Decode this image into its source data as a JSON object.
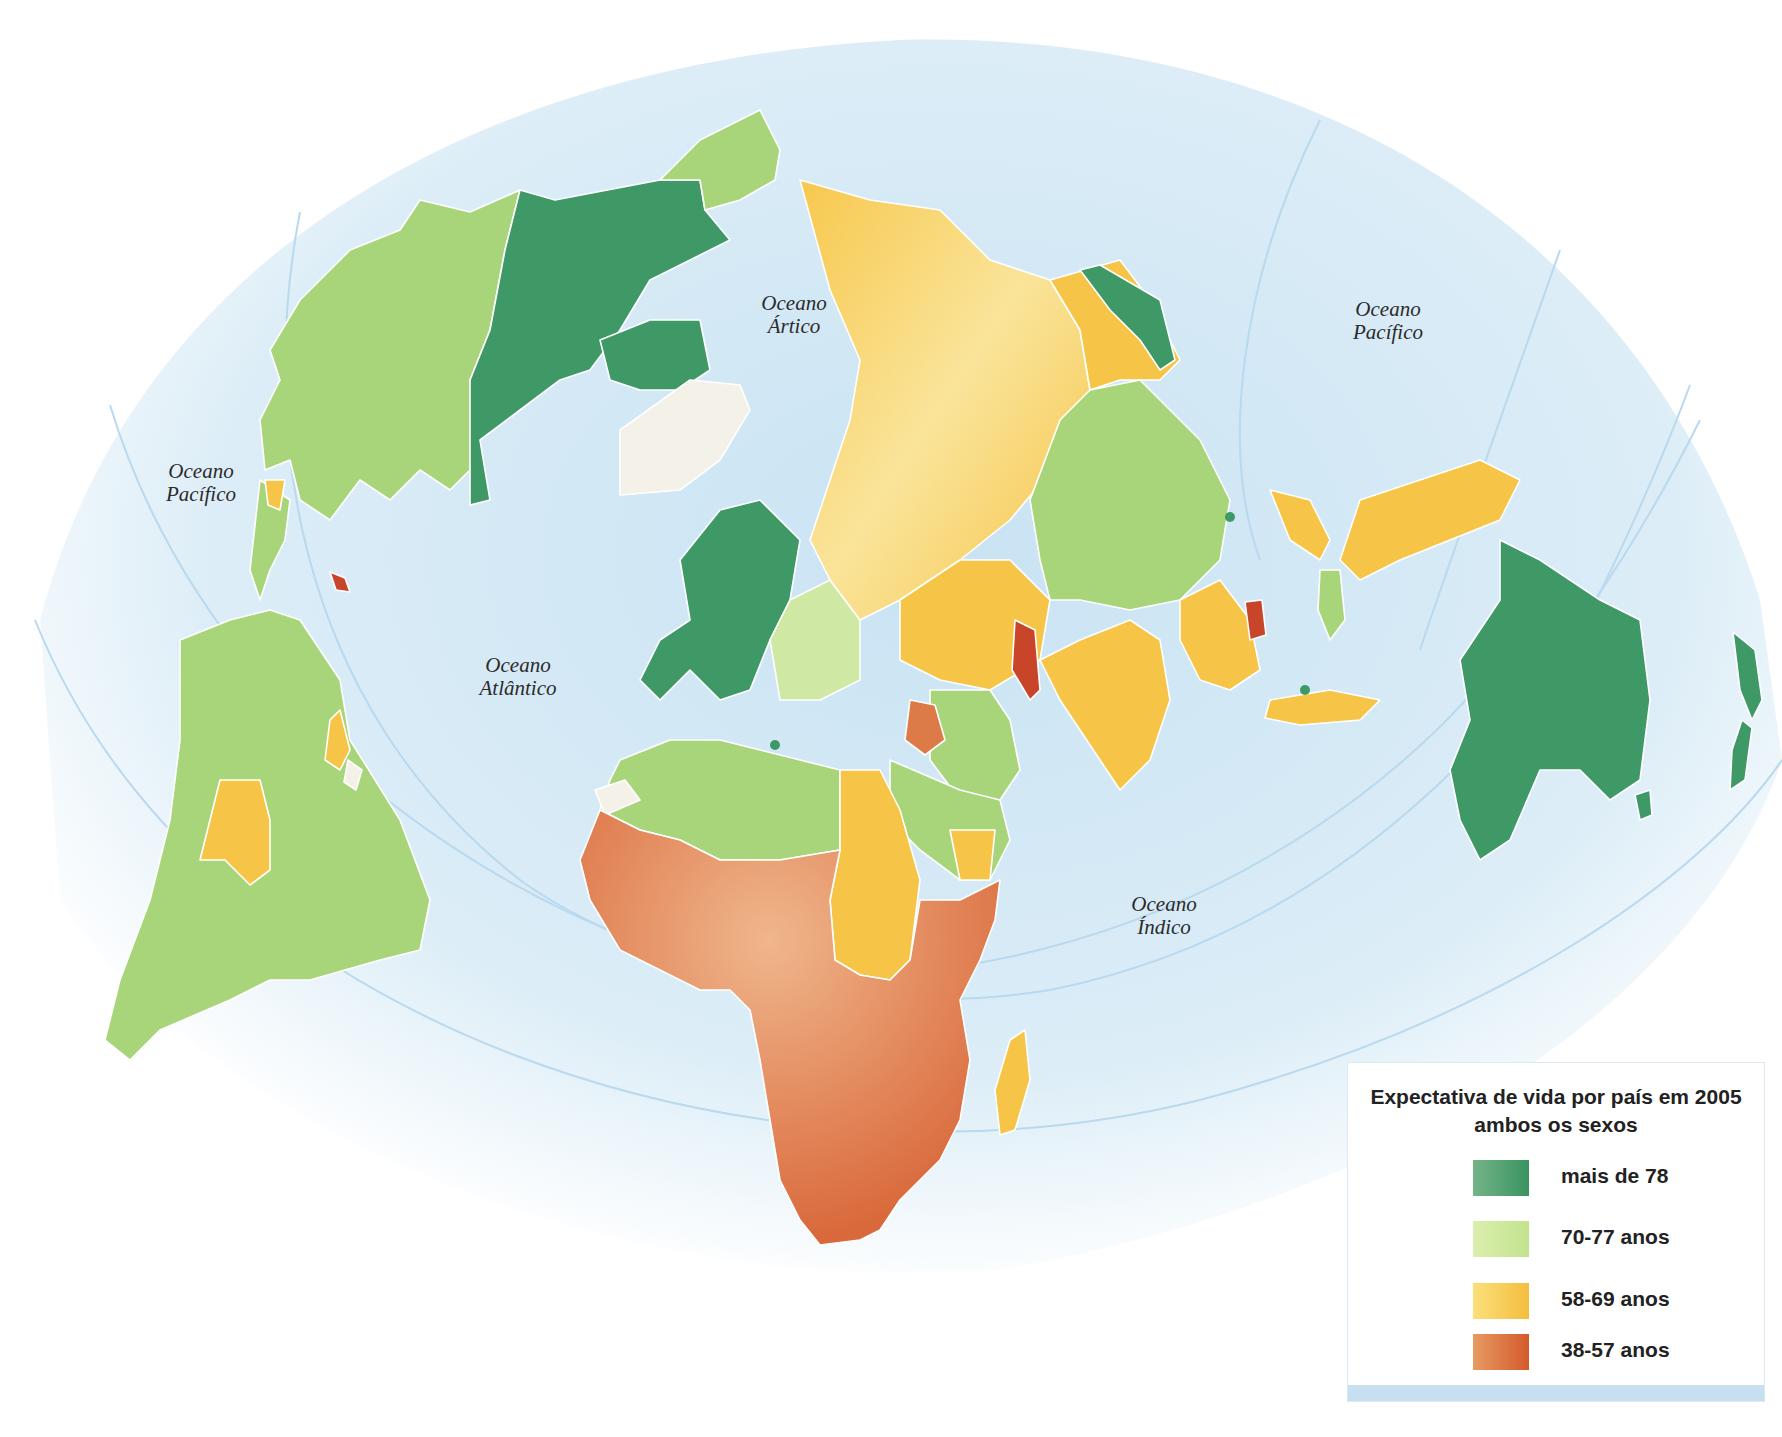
{
  "map": {
    "title": "Expectativa de vida por país em 2005",
    "subtitle": "ambos os sexos",
    "projection": "polar-centered world map",
    "ocean_labels": [
      {
        "line1": "Oceano",
        "line2": "Ártico"
      },
      {
        "line1": "Oceano",
        "line2": "Pacífico"
      },
      {
        "line1": "Oceano",
        "line2": "Pacífico"
      },
      {
        "line1": "Oceano",
        "line2": "Atlântico"
      },
      {
        "line1": "Oceano",
        "line2": "Índico"
      }
    ],
    "colors": {
      "ocean": "#d6ebf6",
      "above_78": "#3f9966",
      "from_70_77": "#a9d57a",
      "from_58_69": "#f6c446",
      "from_38_57": "#dd7b48",
      "critical_red": "#c8452a",
      "no_data": "#f4f1e8",
      "border": "#ffffff"
    },
    "regions": [
      {
        "name": "Canadá",
        "class": "mais de 78"
      },
      {
        "name": "Estados Unidos / Alasca",
        "class": "70-77 anos"
      },
      {
        "name": "Groenlândia",
        "class": "sem dados"
      },
      {
        "name": "América do Sul",
        "class": "70-77 anos"
      },
      {
        "name": "Bolívia",
        "class": "58-69 anos"
      },
      {
        "name": "Guiana / Suriname",
        "class": "58-69 anos"
      },
      {
        "name": "Haiti",
        "class": "38-57 anos"
      },
      {
        "name": "Europa Ocidental",
        "class": "mais de 78"
      },
      {
        "name": "Europa Oriental",
        "class": "70-77 anos"
      },
      {
        "name": "Rússia",
        "class": "58-69 anos"
      },
      {
        "name": "China",
        "class": "70-77 anos"
      },
      {
        "name": "Índia",
        "class": "58-69 anos"
      },
      {
        "name": "Afeganistão",
        "class": "38-57 anos"
      },
      {
        "name": "Iraque",
        "class": "38-57 anos"
      },
      {
        "name": "Camboja",
        "class": "38-57 anos"
      },
      {
        "name": "Japão",
        "class": "mais de 78"
      },
      {
        "name": "Indonésia / Filipinas",
        "class": "58-69 anos"
      },
      {
        "name": "Norte da África / Oriente Médio",
        "class": "70-77 anos"
      },
      {
        "name": "Sudão / Egito / Iêmen",
        "class": "58-69 anos"
      },
      {
        "name": "África Subsaariana",
        "class": "38-57 anos"
      },
      {
        "name": "Madagascar",
        "class": "58-69 anos"
      },
      {
        "name": "Austrália",
        "class": "mais de 78"
      },
      {
        "name": "Nova Zelândia",
        "class": "mais de 78"
      }
    ]
  },
  "legend": {
    "title_line1": "Expectativa de vida por país em 2005",
    "title_line2": "ambos os sexos",
    "items": [
      {
        "label": "mais de 78",
        "color_start": "#74b488",
        "color_end": "#3a9361"
      },
      {
        "label": "70-77 anos",
        "color_start": "#dcefae",
        "color_end": "#c2e38e"
      },
      {
        "label": "58-69 anos",
        "color_start": "#fbe07c",
        "color_end": "#f4bd3e"
      },
      {
        "label": "38-57 anos",
        "color_start": "#e79a62",
        "color_end": "#d45a2c"
      }
    ]
  }
}
